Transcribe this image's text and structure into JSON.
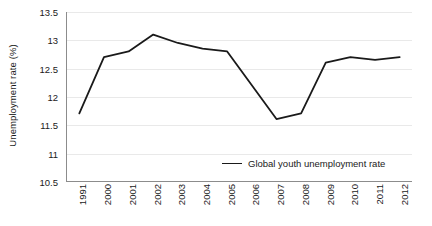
{
  "chart_data": {
    "type": "line",
    "title": "",
    "xlabel": "",
    "ylabel": "Unemployment rate (%)",
    "ylim": [
      10.5,
      13.5
    ],
    "ytick_step": 0.5,
    "yticks": [
      "13.5",
      "13",
      "12.5",
      "12",
      "11.5",
      "11",
      "10.5"
    ],
    "ytick_values": [
      13.5,
      13,
      12.5,
      12,
      11.5,
      11,
      10.5
    ],
    "grid": true,
    "legend_position": "inside-bottom-right",
    "categories": [
      "1991",
      "2000",
      "2001",
      "2002",
      "2003",
      "2004",
      "2005",
      "2006",
      "2007",
      "2008",
      "2009",
      "2010",
      "2011",
      "2012"
    ],
    "series": [
      {
        "name": "Global youth unemployment rate",
        "color": "#1a1a1a",
        "values": [
          11.7,
          12.7,
          12.8,
          13.1,
          12.95,
          12.85,
          12.8,
          12.2,
          11.6,
          11.7,
          12.6,
          12.7,
          12.65,
          12.7
        ]
      }
    ]
  },
  "axes": {
    "y_title": "Unemployment rate (%)"
  },
  "legend": {
    "entries": [
      {
        "label": "Global youth unemployment rate"
      }
    ]
  }
}
